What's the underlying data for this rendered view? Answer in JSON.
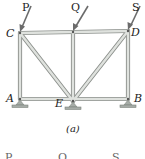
{
  "figure": {
    "caption": "(a)",
    "loads": [
      {
        "label": "P",
        "x": 22,
        "y": 3
      },
      {
        "label": "Q",
        "x": 70,
        "y": 3
      },
      {
        "label": "S",
        "x": 131,
        "y": 3
      }
    ],
    "joints": [
      {
        "label": "C",
        "x": 6,
        "y": 28
      },
      {
        "label": "D",
        "x": 130,
        "y": 27
      },
      {
        "label": "A",
        "x": 7,
        "y": 93
      },
      {
        "label": "E",
        "x": 55,
        "y": 98
      },
      {
        "label": "B",
        "x": 133,
        "y": 93
      }
    ],
    "next_figure_labels": [
      "P",
      "Q",
      "S"
    ],
    "colors": {
      "member": "#d9dcd8",
      "member_edge": "#8c908c",
      "arrow": "#6b6b6b",
      "support": "#8f9690"
    }
  }
}
